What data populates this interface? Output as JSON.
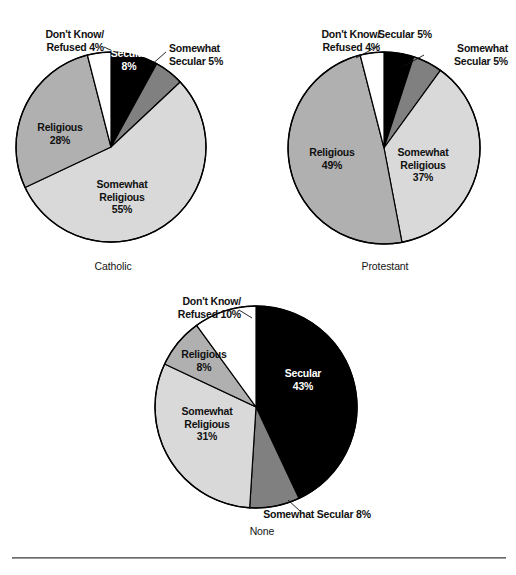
{
  "figure": {
    "background_color": "#ffffff",
    "divider_color": "#6b6b6b"
  },
  "palette": {
    "secular": "#000000",
    "somewhat_secular": "#808080",
    "somewhat_religious": "#d9d9d9",
    "religious": "#b0b0b0",
    "dont_know": "#ffffff",
    "outline": "#000000",
    "text": "#111111",
    "text_on_dark": "#ffffff"
  },
  "chart_data": [
    {
      "type": "pie",
      "title": "Catholic",
      "caption": "Catholic",
      "start_angle": 0,
      "direction": "clockwise",
      "center": {
        "x": 111,
        "y": 147
      },
      "radius": 95,
      "categories": [
        "Secular",
        "Somewhat Secular",
        "Somewhat Religious",
        "Religious",
        "Don't Know/Refused"
      ],
      "values": [
        8,
        5,
        55,
        28,
        4
      ],
      "unit": "%",
      "slices": [
        {
          "label": "Secular",
          "value": 8,
          "value_text": "8%",
          "color": "#000000",
          "label_text": "Secular\n8%",
          "label_placement": "inside",
          "label_on_dark": true
        },
        {
          "label": "Somewhat Secular",
          "value": 5,
          "value_text": "5%",
          "color": "#808080",
          "label_text": "Somewhat\nSecular 5%",
          "label_placement": "outside",
          "label_on_dark": false
        },
        {
          "label": "Somewhat Religious",
          "value": 55,
          "value_text": "55%",
          "color": "#d9d9d9",
          "label_text": "Somewhat\nReligious\n55%",
          "label_placement": "inside",
          "label_on_dark": false
        },
        {
          "label": "Religious",
          "value": 28,
          "value_text": "28%",
          "color": "#b0b0b0",
          "label_text": "Religious\n28%",
          "label_placement": "inside",
          "label_on_dark": false
        },
        {
          "label": "Don't Know/Refused",
          "value": 4,
          "value_text": "4%",
          "color": "#ffffff",
          "label_text": "Don't Know/\nRefused 4%",
          "label_placement": "outside",
          "label_on_dark": false
        }
      ]
    },
    {
      "type": "pie",
      "title": "Protestant",
      "caption": "Protestant",
      "start_angle": 0,
      "direction": "clockwise",
      "center": {
        "x": 384,
        "y": 148
      },
      "radius": 96,
      "categories": [
        "Secular",
        "Somewhat Secular",
        "Somewhat Religious",
        "Religious",
        "Don't Know/Refused"
      ],
      "values": [
        5,
        5,
        37,
        49,
        4
      ],
      "unit": "%",
      "slices": [
        {
          "label": "Secular",
          "value": 5,
          "value_text": "5%",
          "color": "#000000",
          "label_text": "Secular 5%",
          "label_placement": "outside",
          "label_on_dark": false
        },
        {
          "label": "Somewhat Secular",
          "value": 5,
          "value_text": "5%",
          "color": "#808080",
          "label_text": "Somewhat\nSecular 5%",
          "label_placement": "outside",
          "label_on_dark": false
        },
        {
          "label": "Somewhat Religious",
          "value": 37,
          "value_text": "37%",
          "color": "#d9d9d9",
          "label_text": "Somewhat\nReligious\n37%",
          "label_placement": "inside",
          "label_on_dark": false
        },
        {
          "label": "Religious",
          "value": 49,
          "value_text": "49%",
          "color": "#b0b0b0",
          "label_text": "Religious\n49%",
          "label_placement": "inside",
          "label_on_dark": false
        },
        {
          "label": "Don't Know/Refused",
          "value": 4,
          "value_text": "4%",
          "color": "#ffffff",
          "label_text": "Don't Know/\nRefused 4%",
          "label_placement": "outside",
          "label_on_dark": false
        }
      ]
    },
    {
      "type": "pie",
      "title": "None",
      "caption": "None",
      "start_angle": 0,
      "direction": "clockwise",
      "center": {
        "x": 256,
        "y": 407
      },
      "radius": 101,
      "categories": [
        "Secular",
        "Somewhat Secular",
        "Somewhat Religious",
        "Religious",
        "Don't Know/Refused"
      ],
      "values": [
        43,
        8,
        31,
        8,
        10
      ],
      "unit": "%",
      "slices": [
        {
          "label": "Secular",
          "value": 43,
          "value_text": "43%",
          "color": "#000000",
          "label_text": "Secular\n43%",
          "label_placement": "inside",
          "label_on_dark": true
        },
        {
          "label": "Somewhat Secular",
          "value": 8,
          "value_text": "8%",
          "color": "#808080",
          "label_text": "Somewhat Secular 8%",
          "label_placement": "outside",
          "label_on_dark": false
        },
        {
          "label": "Somewhat Religious",
          "value": 31,
          "value_text": "31%",
          "color": "#d9d9d9",
          "label_text": "Somewhat\nReligious\n31%",
          "label_placement": "inside",
          "label_on_dark": false
        },
        {
          "label": "Religious",
          "value": 8,
          "value_text": "8%",
          "color": "#b0b0b0",
          "label_text": "Religious\n8%",
          "label_placement": "inside",
          "label_on_dark": false
        },
        {
          "label": "Don't Know/Refused",
          "value": 10,
          "value_text": "10%",
          "color": "#ffffff",
          "label_text": "Don't Know/\nRefused 10%",
          "label_placement": "outside",
          "label_on_dark": false
        }
      ]
    }
  ],
  "labels": {
    "c1_dontknow": "Don't Know/\nRefused 4%",
    "c1_secular": "Secular\n8%",
    "c1_somewhat_secular": "Somewhat\nSecular 5%",
    "c1_somewhat_religious": "Somewhat\nReligious\n55%",
    "c1_religious": "Religious\n28%",
    "c1_caption": "Catholic",
    "c2_dontknow": "Don't Know/\nRefused 4%",
    "c2_secular": "Secular 5%",
    "c2_somewhat_secular": "Somewhat\nSecular 5%",
    "c2_somewhat_religious": "Somewhat\nReligious\n37%",
    "c2_religious": "Religious\n49%",
    "c2_caption": "Protestant",
    "c3_dontknow": "Don't Know/\nRefused 10%",
    "c3_secular": "Secular\n43%",
    "c3_somewhat_secular": "Somewhat Secular 8%",
    "c3_somewhat_religious": "Somewhat\nReligious\n31%",
    "c3_religious": "Religious\n8%",
    "c3_caption": "None"
  }
}
